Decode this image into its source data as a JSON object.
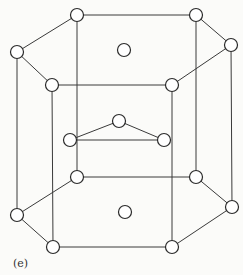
{
  "figure": {
    "label": "(e)",
    "atom_radius": 6.5,
    "nodes": {
      "top": [
        [
          77,
          15
        ],
        [
          196,
          15
        ],
        [
          231,
          45
        ],
        [
          172,
          85
        ],
        [
          52,
          85
        ],
        [
          17,
          52
        ]
      ],
      "top_center": [
        124,
        50
      ],
      "middle": [
        [
          119,
          121
        ],
        [
          70,
          140
        ],
        [
          164,
          140
        ]
      ],
      "bottom": [
        [
          77,
          177
        ],
        [
          196,
          177
        ],
        [
          232,
          207
        ],
        [
          172,
          247
        ],
        [
          53,
          247
        ],
        [
          17,
          215
        ]
      ],
      "bottom_center": [
        125,
        212
      ]
    }
  }
}
